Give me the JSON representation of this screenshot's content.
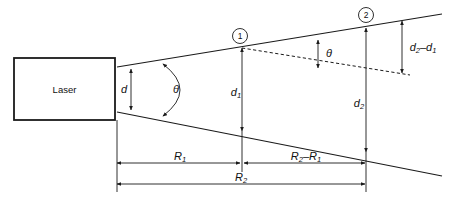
{
  "figure": {
    "type": "technical-line-diagram",
    "background_color": "#ffffff",
    "line_color": "#1a1a1a"
  },
  "source": {
    "label": "Laser",
    "box": {
      "x": 14,
      "y": 58,
      "width": 101,
      "height": 62
    }
  },
  "labels": {
    "aperture_diameter": "d",
    "divergence_angle": "θ",
    "angle_at_point1": "θ",
    "diameter_1": "d",
    "diameter_1_sub": "1",
    "diameter_2": "d",
    "diameter_2_sub": "2",
    "diameter_difference_first": "d",
    "diameter_difference_first_sub": "2",
    "diameter_difference_op": "–",
    "diameter_difference_second": "d",
    "diameter_difference_second_sub": "1",
    "range_1": "R",
    "range_1_sub": "1",
    "range_2": "R",
    "range_2_sub": "2",
    "range_delta_first": "R",
    "range_delta_first_sub": "2",
    "range_delta_op": "–",
    "range_delta_second": "R",
    "range_delta_second_sub": "1",
    "marker_1": "1",
    "marker_2": "2"
  },
  "geometry": {
    "upper_beam": {
      "x1": 117,
      "y1": 67,
      "x2": 442,
      "y2": 14
    },
    "lower_beam": {
      "x1": 117,
      "y1": 112,
      "x2": 442,
      "y2": 176
    },
    "dashed_line": {
      "x1": 242,
      "y1": 48,
      "x2": 410,
      "y2": 75
    },
    "marker_1_point": {
      "x": 242,
      "y": 48,
      "circle_x": 240,
      "circle_y": 36,
      "r": 7.5
    },
    "marker_2_point": {
      "x": 366,
      "y": 28,
      "circle_x": 366,
      "circle_y": 15,
      "r": 7.5
    },
    "dim_d": {
      "x": 131,
      "y_top": 69,
      "y_bottom": 110,
      "label_x": 124,
      "label_y": 90
    },
    "dim_d1": {
      "x": 242,
      "y_top": 48,
      "y_bottom": 131,
      "label_x": 234,
      "label_y": 93
    },
    "dim_d2": {
      "x": 366,
      "y_top": 28,
      "y_bottom": 152,
      "label_x": 357,
      "label_y": 104
    },
    "dim_theta2": {
      "x": 318,
      "y_top": 40,
      "y_bottom": 68,
      "label_x": 328,
      "label_y": 54
    },
    "dim_dd": {
      "x": 402,
      "y_top": 21,
      "y_bottom": 73,
      "label_x": 421,
      "label_y": 48
    },
    "dim_R1": {
      "y": 163,
      "x_left": 117,
      "x_right": 242,
      "label_x": 180,
      "label_y": 158
    },
    "dim_R2R1": {
      "y": 163,
      "x_left": 248,
      "x_right": 366,
      "label_x": 307,
      "label_y": 158
    },
    "dim_R2": {
      "y": 184,
      "x_left": 117,
      "x_right": 366,
      "label_x": 241,
      "label_y": 179
    },
    "theta_arc": {
      "cx": 190,
      "cy": 90,
      "label_x": 176,
      "label_y": 90
    },
    "ext_left": {
      "x": 117,
      "y_top": 120,
      "y_bottom": 190
    },
    "ext_mid": {
      "x": 242,
      "y_top": 131,
      "y_bottom": 172
    },
    "ext_right": {
      "x": 366,
      "y_top": 152,
      "y_bottom": 190
    }
  }
}
